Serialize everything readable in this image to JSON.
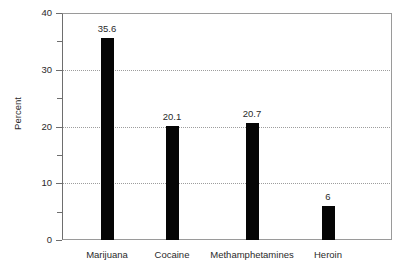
{
  "chart_data": {
    "type": "bar",
    "title": "",
    "xlabel": "",
    "ylabel": "Percent",
    "categories": [
      "Marijuana",
      "Cocaine",
      "Methamphetamines",
      "Heroin"
    ],
    "values": [
      35.6,
      20.1,
      20.7,
      6
    ],
    "value_labels": [
      "35.6",
      "20.1",
      "20.7",
      "6"
    ],
    "ylim": [
      0,
      40
    ],
    "ytick_labels": [
      "0",
      "10",
      "20",
      "30",
      "40"
    ],
    "ytick_values": [
      0,
      10,
      20,
      30,
      40
    ],
    "yminor_tick_values": [
      5,
      15,
      25,
      35
    ],
    "gridlines_at": [
      10,
      20,
      30
    ],
    "grid": true,
    "grid_style": "dotted",
    "legend": false,
    "bar_color": "#050505",
    "grid_color": "#9d9d9d",
    "axis_color": "#6e6e6e",
    "frame_color": "#9a9a9a",
    "text_color": "#2a2a2a",
    "background": "#ffffff"
  },
  "title_sliver": {
    "text": ""
  }
}
